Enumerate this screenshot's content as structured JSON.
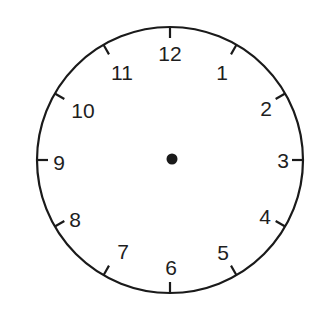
{
  "clock": {
    "center": {
      "x": 170,
      "y": 160
    },
    "radius": 133,
    "stroke_color": "#1a1a1a",
    "center_dot_radius": 5.5,
    "tick_length": 11,
    "numbers": [
      {
        "label": "12",
        "x": 170,
        "y": 53
      },
      {
        "label": "1",
        "x": 222,
        "y": 72
      },
      {
        "label": "2",
        "x": 266,
        "y": 108
      },
      {
        "label": "3",
        "x": 283,
        "y": 160
      },
      {
        "label": "4",
        "x": 265,
        "y": 216
      },
      {
        "label": "5",
        "x": 223,
        "y": 252
      },
      {
        "label": "6",
        "x": 171,
        "y": 267
      },
      {
        "label": "7",
        "x": 123,
        "y": 251
      },
      {
        "label": "8",
        "x": 75,
        "y": 219
      },
      {
        "label": "9",
        "x": 59,
        "y": 162
      },
      {
        "label": "10",
        "x": 83,
        "y": 110
      },
      {
        "label": "11",
        "x": 122,
        "y": 72
      }
    ]
  }
}
